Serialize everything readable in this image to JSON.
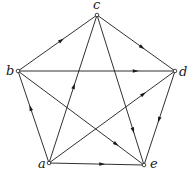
{
  "diagram": {
    "type": "directed-graph",
    "colors": {
      "edge": "#1a1a1a",
      "node_fill": "#ffffff",
      "background": "#ffffff"
    },
    "nodes": [
      {
        "id": "a",
        "label": "a",
        "x": 49,
        "y": 163,
        "lx": 38,
        "ly": 168
      },
      {
        "id": "b",
        "label": "b",
        "x": 18,
        "y": 71,
        "lx": 6,
        "ly": 75
      },
      {
        "id": "c",
        "label": "c",
        "x": 97,
        "y": 15,
        "lx": 93,
        "ly": 9
      },
      {
        "id": "d",
        "label": "d",
        "x": 175,
        "y": 71,
        "lx": 179,
        "ly": 76
      },
      {
        "id": "e",
        "label": "e",
        "x": 144,
        "y": 165,
        "lx": 150,
        "ly": 168
      }
    ],
    "edges": [
      {
        "from": "b",
        "to": "c",
        "arrow_t": 0.55
      },
      {
        "from": "c",
        "to": "d",
        "arrow_t": 0.58
      },
      {
        "from": "b",
        "to": "d",
        "arrow_t": 0.75
      },
      {
        "from": "a",
        "to": "b",
        "arrow_t": 0.6
      },
      {
        "from": "a",
        "to": "c",
        "arrow_t": 0.52
      },
      {
        "from": "c",
        "to": "e",
        "arrow_t": 0.77
      },
      {
        "from": "b",
        "to": "e",
        "arrow_t": 0.78
      },
      {
        "from": "a",
        "to": "d",
        "arrow_t": 0.75
      },
      {
        "from": "d",
        "to": "e",
        "arrow_t": 0.52
      },
      {
        "from": "a",
        "to": "e",
        "arrow_t": 0.56
      }
    ]
  }
}
